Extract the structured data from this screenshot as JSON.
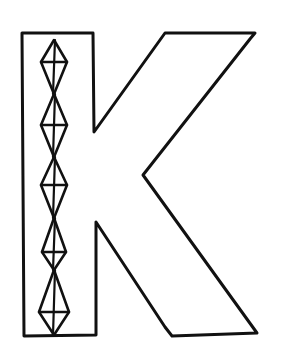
{
  "image": {
    "subject": "Hand-drawn outline letter K",
    "letter": "K",
    "background_color": "#ffffff",
    "ink_color": "#111111"
  },
  "drawing": {
    "stem": {
      "points": [
        [
          22,
          33
        ],
        [
          93,
          33
        ],
        [
          94,
          132
        ],
        [
          165,
          33
        ],
        [
          255,
          33
        ],
        [
          250,
          39
        ],
        [
          143,
          175
        ],
        [
          257,
          333
        ],
        [
          172,
          336
        ],
        [
          165,
          327
        ],
        [
          96,
          222
        ],
        [
          96,
          335
        ],
        [
          24,
          336
        ]
      ]
    },
    "diamond_chain": {
      "count": 5,
      "center_x": 54,
      "diamonds": [
        {
          "top": 40,
          "widest": 62,
          "bottom": 94,
          "half_width": 13
        },
        {
          "top": 94,
          "widest": 125,
          "bottom": 157,
          "half_width": 13
        },
        {
          "top": 157,
          "widest": 185,
          "bottom": 218,
          "half_width": 13
        },
        {
          "top": 218,
          "widest": 252,
          "bottom": 270,
          "half_width": 12
        },
        {
          "top": 270,
          "widest": 312,
          "bottom": 335,
          "half_width": 15
        }
      ]
    }
  }
}
